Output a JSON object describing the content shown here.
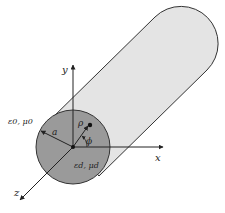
{
  "diagram": {
    "type": "dielectric-cylinder-coordinates",
    "labels": {
      "y_axis": "y",
      "x_axis": "x",
      "z_axis": "z",
      "outer_medium": "ε0, μ0",
      "radius": "a",
      "rho": "ρ",
      "phi": "ϕ",
      "inner_medium": "εd, μd"
    },
    "colors": {
      "cylinder_body": "#e4e4e4",
      "cross_section": "#9a9a9a",
      "outline": "#333333",
      "axis": "#222222"
    }
  }
}
